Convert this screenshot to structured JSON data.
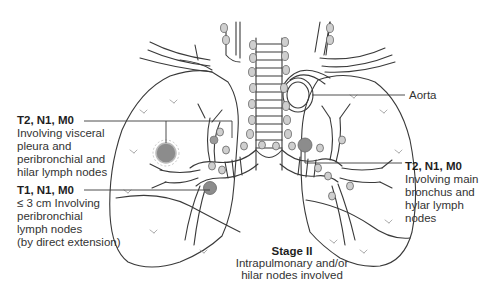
{
  "diagram": {
    "colors": {
      "outline": "#3a3a3a",
      "tumor_fill": "#8c8c8c",
      "node_fill": "#c8c8c8",
      "background": "#ffffff"
    }
  },
  "labels": {
    "t2_left": {
      "title": "T2, N1, M0",
      "lines": [
        "Involving visceral",
        "pleura and",
        "peribronchial and",
        "hilar lymph nodes"
      ]
    },
    "t1": {
      "title": "T1, N1, M0",
      "lines": [
        "≤ 3 cm Involving",
        "peribronchial",
        "lymph nodes",
        "(by direct extension)"
      ]
    },
    "aorta": {
      "title": "Aorta"
    },
    "t2_right": {
      "title": "T2, N1, M0",
      "lines": [
        "Involving main",
        "bronchus and",
        "hylar lymph",
        "nodes"
      ]
    }
  },
  "caption": {
    "title": "Stage II",
    "lines": [
      "Intrapulmonary and/or",
      "hilar nodes involved"
    ]
  }
}
